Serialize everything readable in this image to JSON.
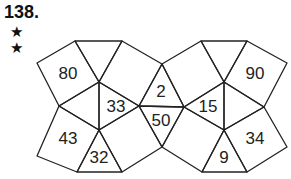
{
  "problem": {
    "number": "138.",
    "difficulty_stars": [
      "★",
      "★"
    ]
  },
  "diagram": {
    "labels": [
      {
        "id": "top-left-square",
        "value": "80",
        "x": 68,
        "y": 73
      },
      {
        "id": "left-center-triangle",
        "value": "33",
        "x": 116,
        "y": 106
      },
      {
        "id": "bottom-left-square",
        "value": "43",
        "x": 68,
        "y": 138
      },
      {
        "id": "bottom-left-triangle",
        "value": "32",
        "x": 99,
        "y": 157
      },
      {
        "id": "center-top-triangle",
        "value": "2",
        "x": 161,
        "y": 91
      },
      {
        "id": "center-bottom-triangle",
        "value": "50",
        "x": 161,
        "y": 120
      },
      {
        "id": "right-center-triangle",
        "value": "15",
        "x": 208,
        "y": 106
      },
      {
        "id": "top-right-square",
        "value": "90",
        "x": 255,
        "y": 73
      },
      {
        "id": "bottom-right-square",
        "value": "34",
        "x": 255,
        "y": 138
      },
      {
        "id": "bottom-right-triangle",
        "value": "9",
        "x": 224,
        "y": 157
      }
    ],
    "stroke_color": "#222222"
  }
}
